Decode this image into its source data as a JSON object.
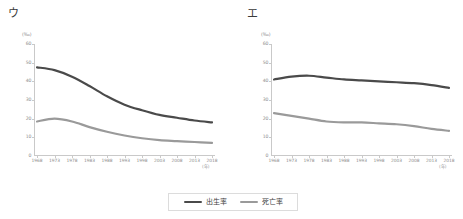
{
  "legend": {
    "entries": [
      {
        "label": "出生率",
        "color": "#4a4a4a"
      },
      {
        "label": "死亡率",
        "color": "#9a9a9a"
      }
    ]
  },
  "panels": [
    {
      "key": "u",
      "title": "ウ",
      "chart_data": {
        "type": "line",
        "title": "ウ",
        "xlabel": "(年)",
        "ylabel": "(‰)",
        "yunit": "(‰)",
        "xunit": "(年)",
        "grid": false,
        "legend_position": "bottom",
        "ylim": [
          0,
          60
        ],
        "yticks": [
          0,
          10,
          20,
          30,
          40,
          50,
          60
        ],
        "categories": [
          "1968",
          "1973",
          "1978",
          "1983",
          "1988",
          "1993",
          "1998",
          "2003",
          "2008",
          "2013",
          "2018"
        ],
        "series": [
          {
            "name": "出生率",
            "color": "#4a4a4a",
            "values": [
              47.5,
              46.0,
              42.5,
              37.5,
              32.0,
              27.5,
              24.5,
              22.0,
              20.5,
              19.0,
              18.0
            ]
          },
          {
            "name": "死亡率",
            "color": "#9a9a9a",
            "values": [
              18.5,
              20.0,
              18.5,
              15.5,
              13.0,
              11.0,
              9.5,
              8.5,
              8.0,
              7.5,
              7.0
            ]
          }
        ]
      }
    },
    {
      "key": "e",
      "title": "エ",
      "chart_data": {
        "type": "line",
        "title": "エ",
        "xlabel": "(年)",
        "ylabel": "(‰)",
        "yunit": "(‰)",
        "xunit": "(年)",
        "grid": false,
        "legend_position": "bottom",
        "ylim": [
          0,
          60
        ],
        "yticks": [
          0,
          10,
          20,
          30,
          40,
          50,
          60
        ],
        "categories": [
          "1968",
          "1973",
          "1978",
          "1983",
          "1988",
          "1993",
          "1998",
          "2003",
          "2008",
          "2013",
          "2018"
        ],
        "series": [
          {
            "name": "出生率",
            "color": "#4a4a4a",
            "values": [
              41.0,
              42.5,
              43.0,
              42.0,
              41.0,
              40.5,
              40.0,
              39.5,
              39.0,
              38.0,
              36.5
            ]
          },
          {
            "name": "死亡率",
            "color": "#9a9a9a",
            "values": [
              23.0,
              21.5,
              20.0,
              18.5,
              18.0,
              18.0,
              17.5,
              17.0,
              16.0,
              14.5,
              13.5
            ]
          }
        ]
      }
    }
  ]
}
